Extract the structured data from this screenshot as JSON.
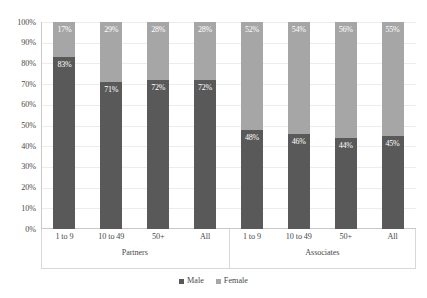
{
  "chart_data": {
    "type": "bar",
    "subtype": "100% stacked column",
    "title": "",
    "xlabel": "",
    "ylabel": "",
    "ylim": [
      0,
      100
    ],
    "y_ticks": [
      "0%",
      "10%",
      "20%",
      "30%",
      "40%",
      "50%",
      "60%",
      "70%",
      "80%",
      "90%",
      "100%"
    ],
    "grid": true,
    "legend_position": "bottom",
    "groups": [
      "Partners",
      "Associates"
    ],
    "categories": [
      "1 to 9",
      "10 to 49",
      "50+",
      "All",
      "1 to 9",
      "10 to 49",
      "50+",
      "All"
    ],
    "series": [
      {
        "name": "Male",
        "color": "#595959",
        "values": [
          83,
          71,
          72,
          72,
          48,
          46,
          44,
          45
        ],
        "labels": [
          "83%",
          "71%",
          "72%",
          "72%",
          "48%",
          "46%",
          "44%",
          "45%"
        ]
      },
      {
        "name": "Female",
        "color": "#a6a6a6",
        "values": [
          17,
          29,
          28,
          28,
          52,
          54,
          56,
          55
        ],
        "labels": [
          "17%",
          "29%",
          "28%",
          "28%",
          "52%",
          "54%",
          "56%",
          "55%"
        ]
      }
    ],
    "bars": [
      {
        "group": "Partners",
        "category": "1 to 9",
        "male": 83,
        "female": 17,
        "male_label": "83%",
        "female_label": "17%"
      },
      {
        "group": "Partners",
        "category": "10 to 49",
        "male": 71,
        "female": 29,
        "male_label": "71%",
        "female_label": "29%"
      },
      {
        "group": "Partners",
        "category": "50+",
        "male": 72,
        "female": 28,
        "male_label": "72%",
        "female_label": "28%"
      },
      {
        "group": "Partners",
        "category": "All",
        "male": 72,
        "female": 28,
        "male_label": "72%",
        "female_label": "28%"
      },
      {
        "group": "Associates",
        "category": "1 to 9",
        "male": 48,
        "female": 52,
        "male_label": "48%",
        "female_label": "52%"
      },
      {
        "group": "Associates",
        "category": "10 to 49",
        "male": 46,
        "female": 54,
        "male_label": "46%",
        "female_label": "54%"
      },
      {
        "group": "Associates",
        "category": "50+",
        "male": 44,
        "female": 56,
        "male_label": "44%",
        "female_label": "56%"
      },
      {
        "group": "Associates",
        "category": "All",
        "male": 45,
        "female": 55,
        "male_label": "45%",
        "female_label": "55%"
      }
    ],
    "legend": [
      {
        "label": "Male",
        "color": "#595959"
      },
      {
        "label": "Female",
        "color": "#a6a6a6"
      }
    ]
  }
}
